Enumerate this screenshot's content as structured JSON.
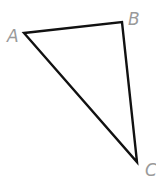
{
  "diagram": {
    "type": "triangle",
    "stroke_color": "#111111",
    "label_color": "#9a9a9a",
    "vertices": [
      {
        "label": "A",
        "x": 24,
        "y": 33
      },
      {
        "label": "B",
        "x": 122,
        "y": 22
      },
      {
        "label": "C",
        "x": 137,
        "y": 162
      }
    ]
  }
}
